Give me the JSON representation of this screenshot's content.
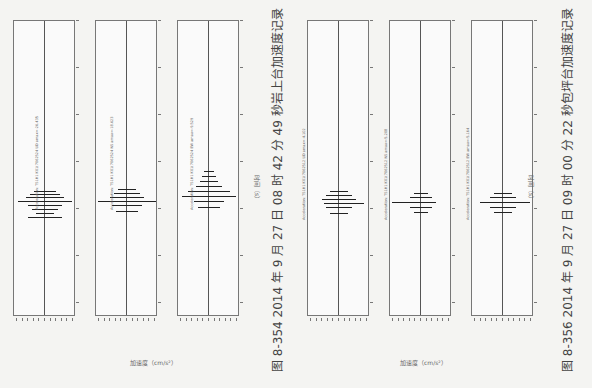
{
  "figures": [
    {
      "id": "fig-8-354",
      "caption": "图 8-354    2014 年 9 月 27 日 08 时 42 分 49 秒岩上台加速度记录",
      "x_axis_title": "加速度（cm/s²）",
      "time_axis_title": "时间（s）",
      "traces": [
        {
          "label": "Acceleration: TS1H1 K01(7062524 UD amax=-26.435"
        },
        {
          "label": "Acceleration: TS1H1 K01(7062524 NS amax=-18.623"
        },
        {
          "label": "Acceleration: TS1H1 K01(7062524 EW amax=-9.529"
        }
      ]
    },
    {
      "id": "fig-8-356",
      "caption": "图 8-356    2014 年 9 月 27 日 09 时 00 分 22 秒包坪台加速度记录",
      "x_axis_title": "加速度（cm/s²）",
      "time_axis_title": "时间（s）",
      "traces": [
        {
          "label": "Acceleration: TS1H1 K01(7062512 UD amax=-4.102"
        },
        {
          "label": "Acceleration: TS1H1 K01(7062512 NS amax=-5.208"
        },
        {
          "label": "Acceleration: TS1H1 K01(7062512 EW amax=-5.164"
        }
      ]
    }
  ],
  "time_ticks": [
    "0",
    "10",
    "20",
    "30",
    "40",
    "50",
    "60",
    "70",
    "80",
    "90",
    "100",
    "110",
    "120",
    "130",
    "140"
  ],
  "chart_data": [
    {
      "type": "line",
      "title": "图 8-354 2014 年 9 月 27 日 08 时 42 分 49 秒岩上台加速度记录",
      "xlabel": "时间（s）",
      "ylabel": "加速度（cm/s²）",
      "series": [
        {
          "name": "UD",
          "amax": -26.435
        },
        {
          "name": "NS",
          "amax": -18.623
        },
        {
          "name": "EW",
          "amax": -9.529
        }
      ]
    },
    {
      "type": "line",
      "title": "图 8-356 2014 年 9 月 27 日 09 时 00 分 22 秒包坪台加速度记录",
      "xlabel": "时间（s）",
      "ylabel": "加速度（cm/s²）",
      "series": [
        {
          "name": "UD",
          "amax": -4.102
        },
        {
          "name": "NS",
          "amax": -5.208
        },
        {
          "name": "EW",
          "amax": -5.164
        }
      ]
    }
  ]
}
